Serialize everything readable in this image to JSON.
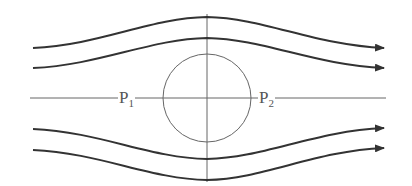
{
  "diagram": {
    "type": "streamlines-around-sphere",
    "colors": {
      "streamline": "#333333",
      "axis": "#666666",
      "circle": "#666666",
      "label": "#555555",
      "background": "#ffffff"
    },
    "flow_direction": "left-to-right",
    "streamline_count": 4,
    "circle": {
      "cx": 207,
      "cy": 98,
      "r": 44
    },
    "labels": {
      "p1": {
        "base": "P",
        "sub": "1"
      },
      "p2": {
        "base": "P",
        "sub": "2"
      }
    }
  }
}
